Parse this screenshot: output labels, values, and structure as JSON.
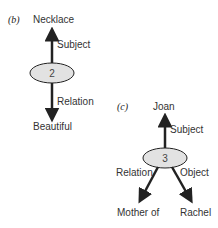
{
  "diagram_b": {
    "panel_label": "(b)",
    "node_number": "2",
    "top_node": "Necklace",
    "top_edge_label": "Subject",
    "bottom_edge_label": "Relation",
    "bottom_node": "Beautiful"
  },
  "diagram_c": {
    "panel_label": "(c)",
    "node_number": "3",
    "top_node": "Joan",
    "top_edge_label": "Subject",
    "left_edge_label": "Relation",
    "right_edge_label": "Object",
    "left_node": "Mother of",
    "right_node": "Rachel"
  },
  "colors": {
    "ellipse_fill": "#e2e2e2",
    "stroke": "#222222"
  }
}
